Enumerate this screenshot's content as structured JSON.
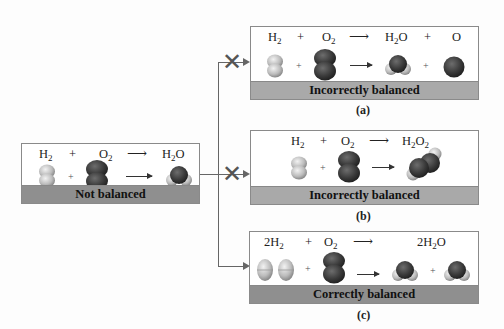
{
  "initial": {
    "equation": {
      "reactant1": "H",
      "reactant1_sub": "2",
      "plus": "+",
      "reactant2": "O",
      "reactant2_sub": "2",
      "arrow": "⟶",
      "product": "H",
      "product_sub": "2",
      "product_tail": "O"
    },
    "label": "Not balanced"
  },
  "options": [
    {
      "id": "a",
      "caption": "(a)",
      "label": "Incorrectly balanced",
      "crossed": true,
      "equation": {
        "r1": "H",
        "r1_sub": "2",
        "plus": "+",
        "r2": "O",
        "r2_sub": "2",
        "arrow": "⟶",
        "p1": "H",
        "p1_sub": "2",
        "p1_tail": "O",
        "plus2": "+",
        "p2": "O"
      }
    },
    {
      "id": "b",
      "caption": "(b)",
      "label": "Incorrectly balanced",
      "crossed": true,
      "equation": {
        "r1": "H",
        "r1_sub": "2",
        "plus": "+",
        "r2": "O",
        "r2_sub": "2",
        "arrow": "⟶",
        "p1": "H",
        "p1_sub": "2",
        "p1_mid": "O",
        "p1_sub2": "2"
      }
    },
    {
      "id": "c",
      "caption": "(c)",
      "label": "Correctly balanced",
      "crossed": false,
      "equation": {
        "r1_coef": "2H",
        "r1_sub": "2",
        "plus": "+",
        "r2": "O",
        "r2_sub": "2",
        "arrow": "⟶",
        "p1_coef": "2H",
        "p1_sub": "2",
        "p1_tail": "O"
      }
    }
  ],
  "symbols": {
    "plus": "+",
    "cross": "✕"
  },
  "colors": {
    "hydrogen": "#d8d8d8",
    "oxygen": "#3c3c3c",
    "bar": "#a9a9a9",
    "bar_correct": "#8f8f8f",
    "connector": "#666666"
  }
}
